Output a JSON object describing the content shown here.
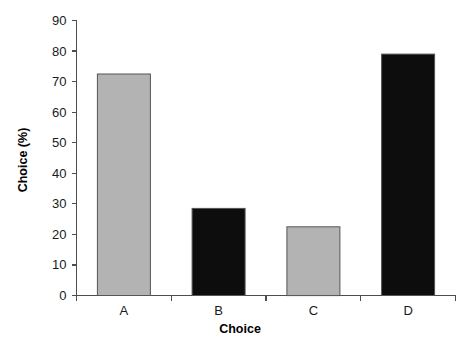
{
  "chart_data": {
    "type": "bar",
    "title": "",
    "categories": [
      "A",
      "B",
      "C",
      "D"
    ],
    "values": [
      72.5,
      28.5,
      22.5,
      79.0
    ],
    "series": [
      {
        "name": "Choice",
        "values": [
          72.5,
          28.5,
          22.5,
          79.0
        ],
        "colors": [
          "#b3b3b3",
          "#0d0d0d",
          "#b3b3b3",
          "#0d0d0d"
        ]
      }
    ],
    "xlabel": "Choice",
    "ylabel": "Choice (%)",
    "ylim": [
      0,
      90
    ],
    "yticks": [
      0,
      10,
      20,
      30,
      40,
      50,
      60,
      70,
      80,
      90
    ],
    "ytick_labels": [
      "0",
      "10",
      "20",
      "30",
      "40",
      "50",
      "60",
      "70",
      "80",
      "90"
    ],
    "grid": false,
    "legend": false,
    "legend_position": "none",
    "bar_fill_gray": "#b3b3b3",
    "bar_fill_black": "#0d0d0d",
    "bar_edge_color": "#555555",
    "axis_color": "#4d4d4d",
    "background": "#ffffff"
  },
  "axes": {
    "y_title": "Choice (%)",
    "x_title": "Choice",
    "y_ticks": [
      {
        "value": 90,
        "label": "90"
      },
      {
        "value": 80,
        "label": "80"
      },
      {
        "value": 70,
        "label": "70"
      },
      {
        "value": 60,
        "label": "60"
      },
      {
        "value": 50,
        "label": "50"
      },
      {
        "value": 40,
        "label": "40"
      },
      {
        "value": 30,
        "label": "30"
      },
      {
        "value": 20,
        "label": "20"
      },
      {
        "value": 10,
        "label": "10"
      },
      {
        "value": 0,
        "label": "0"
      }
    ],
    "x_categories": [
      {
        "label": "A",
        "value": 72.5
      },
      {
        "label": "B",
        "value": 28.5
      },
      {
        "label": "C",
        "value": 22.5
      },
      {
        "label": "D",
        "value": 79.0
      }
    ]
  }
}
